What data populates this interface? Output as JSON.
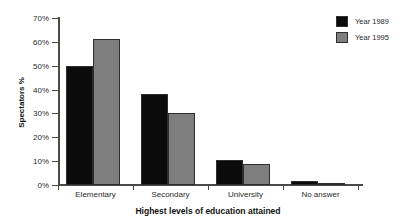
{
  "top_crop_remnant": "",
  "chart_data": {
    "type": "bar",
    "title": "",
    "xlabel": "Highest levels of education attained",
    "ylabel": "Spectators %",
    "categories": [
      "Elementary",
      "Secondary",
      "University",
      "No answer"
    ],
    "series": [
      {
        "name": "Year 1989",
        "color": "#0b0b0b",
        "values": [
          50,
          38,
          10.5,
          1.5
        ]
      },
      {
        "name": "Year 1995",
        "color": "#7e7e7e",
        "values": [
          61,
          30,
          9,
          0.5
        ]
      }
    ],
    "ylim": [
      0,
      70
    ],
    "ytick_values": [
      0,
      10,
      20,
      30,
      40,
      50,
      60,
      70
    ],
    "ytick_labels": [
      "0%",
      "10%",
      "20%",
      "30%",
      "40%",
      "50%",
      "60%",
      "70%"
    ],
    "grid": false,
    "legend_position": "top-right"
  }
}
